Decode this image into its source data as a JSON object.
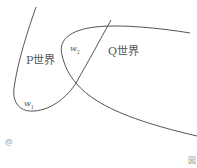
{
  "diagram": {
    "labels": {
      "p_world": "P世界",
      "q_world": "Q世界",
      "w1": "w",
      "w1_sub": "1",
      "w2": "w",
      "w2_sub": "2"
    },
    "marks": {
      "bottom_left": "@",
      "bottom_right": "図"
    },
    "colors": {
      "stroke": "#555555",
      "text": "#555555"
    }
  }
}
